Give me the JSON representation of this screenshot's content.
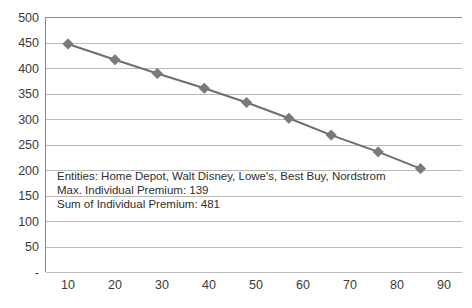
{
  "chart_data": {
    "type": "line",
    "title": "",
    "subtitle": "",
    "xlabel": "",
    "ylabel": "",
    "xlim": [
      0,
      95
    ],
    "ylim": [
      0,
      500
    ],
    "grid": true,
    "legend": "none",
    "marker": "diamond",
    "series": [
      {
        "name": "Premium",
        "color": "#6e6e6e",
        "x": [
          10,
          20,
          29,
          39,
          48,
          57,
          66,
          76,
          85
        ],
        "y": [
          448,
          417,
          390,
          361,
          333,
          302,
          269,
          236,
          203
        ],
        "points": [
          {
            "x": 10,
            "y": 448
          },
          {
            "x": 20,
            "y": 417
          },
          {
            "x": 29,
            "y": 390
          },
          {
            "x": 39,
            "y": 361
          },
          {
            "x": 48,
            "y": 333
          },
          {
            "x": 57,
            "y": 302
          },
          {
            "x": 66,
            "y": 269
          },
          {
            "x": 76,
            "y": 236
          },
          {
            "x": 85,
            "y": 203
          }
        ]
      }
    ],
    "y_ticks": [
      {
        "value": 500,
        "label": "500"
      },
      {
        "value": 450,
        "label": "450"
      },
      {
        "value": 400,
        "label": "400"
      },
      {
        "value": 350,
        "label": "350"
      },
      {
        "value": 300,
        "label": "300"
      },
      {
        "value": 250,
        "label": "250"
      },
      {
        "value": 200,
        "label": "200"
      },
      {
        "value": 150,
        "label": "150"
      },
      {
        "value": 100,
        "label": "100"
      },
      {
        "value": 50,
        "label": "50"
      },
      {
        "value": 0,
        "label": "-"
      }
    ],
    "x_ticks": [
      {
        "value": 10,
        "label": "10"
      },
      {
        "value": 20,
        "label": "20"
      },
      {
        "value": 30,
        "label": "30"
      },
      {
        "value": 40,
        "label": "40"
      },
      {
        "value": 50,
        "label": "50"
      },
      {
        "value": 60,
        "label": "60"
      },
      {
        "value": 70,
        "label": "70"
      },
      {
        "value": 80,
        "label": "80"
      },
      {
        "value": 90,
        "label": "90"
      }
    ],
    "annotations": {
      "line1": "Entities: Home Depot, Walt Disney, Lowe's, Best Buy, Nordstrom",
      "line2": "Max. Individual Premium: 139",
      "line3": "Sum of Individual Premium: 481"
    }
  },
  "colors": {
    "series": "#6e6e6e",
    "marker": "#7a7a7a",
    "grid": "#b9b9b9",
    "axis": "#8a8a8a",
    "text": "#3b3b3b",
    "background": "#ffffff"
  }
}
